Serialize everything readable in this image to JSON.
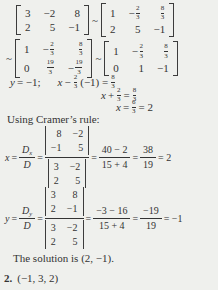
{
  "theme": {
    "background": "#eff0ed",
    "ink": "#333333"
  },
  "rowops": {
    "tilde": "~",
    "m1": {
      "r1c1": "3",
      "r1c2": "−2",
      "r1c3": "8",
      "r2c1": "2",
      "r2c2": "5",
      "r2c3": "−1"
    },
    "m2": {
      "r1c1": "1",
      "r1c2s": "−",
      "r1c2n": "2",
      "r1c2d": "3",
      "r1c3n": "8",
      "r1c3d": "3",
      "r2c1": "2",
      "r2c2": "5",
      "r2c3": "−1"
    },
    "m3": {
      "r1c1": "1",
      "r1c2s": "−",
      "r1c2n": "2",
      "r1c2d": "3",
      "r1c3n": "8",
      "r1c3d": "3",
      "r2c1": "0",
      "r2c2n": "19",
      "r2c2d": "3",
      "r2c3s": "−",
      "r2c3n": "19",
      "r2c3d": "3"
    },
    "m4": {
      "r1c1": "1",
      "r1c2s": "−",
      "r1c2n": "2",
      "r1c2d": "3",
      "r1c3n": "8",
      "r1c3d": "3",
      "r2c1": "0",
      "r2c2": "1",
      "r2c3": "−1"
    }
  },
  "backsub": {
    "y_var": "y",
    "y_rest": "= −1;",
    "x1_var": "x",
    "x1_op": "−",
    "x1_f1n": "2",
    "x1_f1d": "3",
    "x1_mid": "(−1) =",
    "x1_f2n": "8",
    "x1_f2d": "3",
    "x2_var": "x",
    "x2_op": "+",
    "x2_f1n": "2",
    "x2_f1d": "3",
    "x2_mid": "=",
    "x2_f2n": "8",
    "x2_f2d": "3",
    "x3_var": "x",
    "x3_mid": "=",
    "x3_f1n": "6",
    "x3_f1d": "3",
    "x3_post": "= 2"
  },
  "cramer": {
    "heading": "Using Cramer’s rule:",
    "x": {
      "lhs_var": "x",
      "eq0": "=",
      "num_main": "D",
      "num_sub": "x",
      "den": "D",
      "eq1": "=",
      "detn": {
        "r1c1": "8",
        "r1c2": "−2",
        "r2c1": "−1",
        "r2c2": "5"
      },
      "detd": {
        "r1c1": "3",
        "r1c2": "−2",
        "r2c1": "2",
        "r2c2": "5"
      },
      "eq2": "=",
      "f2n": "40 − 2",
      "f2d": "15 + 4",
      "eq3": "=",
      "f3n": "38",
      "f3d": "19",
      "res": "= 2"
    },
    "y": {
      "lhs_var": "y",
      "eq0": "=",
      "num_main": "D",
      "num_sub": "y",
      "den": "D",
      "eq1": "=",
      "detn": {
        "r1c1": "3",
        "r1c2": "8",
        "r2c1": "2",
        "r2c2": "−1"
      },
      "detd": {
        "r1c1": "3",
        "r1c2": "−2",
        "r2c1": "2",
        "r2c2": "5"
      },
      "eq2": "=",
      "f2n": "−3 − 16",
      "f2d": "15 + 4",
      "eq3": "=",
      "f3n": "−19",
      "f3d": "19",
      "res": "= −1"
    }
  },
  "footer": {
    "solution": "The solution is (2, −1).",
    "item_label": "2.",
    "item_value": "(−1, 3, 2)"
  }
}
